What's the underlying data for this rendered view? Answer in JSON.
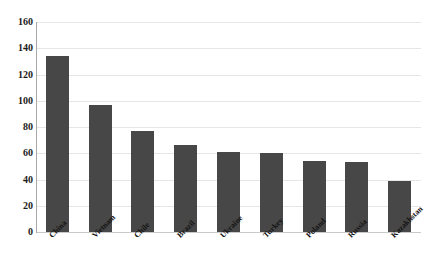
{
  "chart_data": {
    "type": "bar",
    "title": "",
    "subtitle": "",
    "xlabel": "",
    "ylabel": "",
    "categories": [
      "China",
      "Vietnam",
      "Chile",
      "Brazil",
      "Ukraine",
      "Turkey",
      "Poland",
      "Russia",
      "Kazakhstan"
    ],
    "values": [
      134,
      97,
      77,
      66,
      61,
      60,
      54,
      53,
      39
    ],
    "ylim": [
      0,
      160
    ],
    "ytick_labels": [
      "160",
      "140",
      "120",
      "100",
      "80",
      "60",
      "40",
      "20",
      "0"
    ],
    "ytick_values": [
      160,
      140,
      120,
      100,
      80,
      60,
      40,
      20,
      0
    ],
    "grid": true,
    "legend": false,
    "legend_position": "none",
    "series": [
      {
        "name": "",
        "values": [
          134,
          97,
          77,
          66,
          61,
          60,
          54,
          53,
          39
        ]
      }
    ],
    "bar_color": "#474747",
    "gridline_color": "#e6e6e6",
    "axis_color": "#a8a8a8",
    "background_color": "#ffffff",
    "xtick_label_rotation": "-45"
  }
}
